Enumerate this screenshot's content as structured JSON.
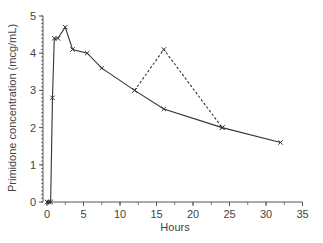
{
  "chart_data": {
    "type": "line",
    "title": "",
    "xlabel": "Hours",
    "ylabel": "Primidone concentration (mcg/mL)",
    "xlim": [
      0,
      35
    ],
    "ylim": [
      0,
      5
    ],
    "x_ticks": [
      0,
      5,
      10,
      15,
      20,
      25,
      30,
      35
    ],
    "y_ticks": [
      0,
      1,
      2,
      3,
      4,
      5
    ],
    "grid": false,
    "legend": null,
    "series": [
      {
        "name": "measured",
        "style": "solid",
        "marker": "x",
        "x": [
          0,
          0.25,
          0.5,
          0.75,
          1,
          1.5,
          2.5,
          3.5,
          5.5,
          7.5,
          12,
          16,
          24,
          32
        ],
        "values": [
          0,
          0,
          0,
          2.8,
          4.4,
          4.4,
          4.7,
          4.1,
          4.0,
          3.6,
          3.0,
          2.5,
          2.0,
          1.6
        ]
      },
      {
        "name": "deviation",
        "style": "dashed",
        "marker": "x",
        "x": [
          12,
          16,
          24
        ],
        "values": [
          3.0,
          4.1,
          2.0
        ]
      }
    ]
  },
  "colors": {
    "line": "#333333",
    "axis": "#555555",
    "text": "#444444"
  }
}
